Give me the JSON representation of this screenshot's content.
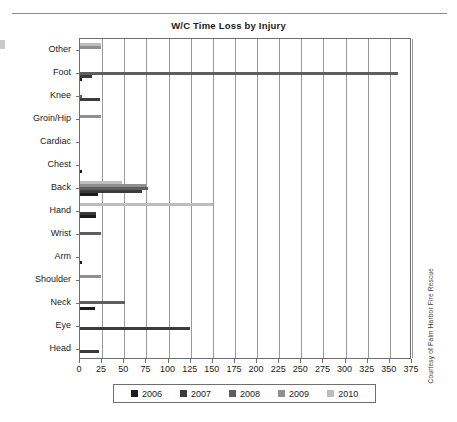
{
  "figure": {
    "title": "W/C Time Loss by Injury",
    "credit": "Courtesy of Palm Harbor Fire Rescue"
  },
  "chart_data": {
    "type": "bar",
    "orientation": "horizontal",
    "title": "W/C Time Loss by Injury",
    "xlabel": "",
    "ylabel": "",
    "xlim": [
      0,
      375
    ],
    "xticks": [
      0,
      25,
      50,
      75,
      100,
      125,
      150,
      175,
      200,
      225,
      250,
      275,
      300,
      325,
      350,
      375
    ],
    "grid": true,
    "legend_position": "bottom",
    "categories": [
      "Other",
      "Foot",
      "Knee",
      "Groin/Hip",
      "Cardiac",
      "Chest",
      "Back",
      "Hand",
      "Wrist",
      "Arm",
      "Shoulder",
      "Neck",
      "Eye",
      "Head"
    ],
    "series": [
      {
        "name": "2006",
        "color": "#1c1c1c",
        "values": [
          0,
          2,
          0,
          0,
          0,
          2,
          20,
          18,
          0,
          2,
          0,
          17,
          0,
          0
        ]
      },
      {
        "name": "2007",
        "color": "#3b3b3b",
        "values": [
          0,
          13,
          23,
          0,
          0,
          0,
          70,
          18,
          0,
          0,
          0,
          0,
          124,
          22
        ]
      },
      {
        "name": "2008",
        "color": "#5e5e5e",
        "values": [
          0,
          359,
          2,
          0,
          0,
          0,
          77,
          0,
          24,
          0,
          0,
          51,
          0,
          0
        ]
      },
      {
        "name": "2009",
        "color": "#8f8f8f",
        "values": [
          24,
          0,
          0,
          24,
          0,
          0,
          75,
          0,
          0,
          0,
          24,
          0,
          0,
          0
        ]
      },
      {
        "name": "2010",
        "color": "#bdbdbd",
        "values": [
          24,
          0,
          0,
          0,
          0,
          0,
          48,
          150,
          0,
          0,
          0,
          0,
          0,
          0
        ]
      }
    ]
  }
}
